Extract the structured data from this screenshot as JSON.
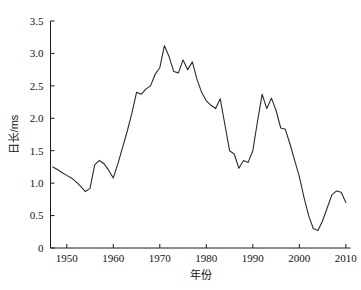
{
  "chart_data": {
    "type": "line",
    "title": "",
    "xlabel": "年份",
    "ylabel": "日长/ms",
    "xlim": [
      1946.5,
      2011.0
    ],
    "ylim": [
      0,
      3.5
    ],
    "grid": false,
    "legend": null,
    "xticks": [
      "1950",
      "1960",
      "1970",
      "1980",
      "1990",
      "2000",
      "2010"
    ],
    "xtick_values": [
      1950,
      1960,
      1970,
      1980,
      1990,
      2000,
      2010
    ],
    "yticks": [
      "0",
      "0.5",
      "1.0",
      "1.5",
      "2.0",
      "2.5",
      "3.0",
      "3.5"
    ],
    "ytick_values": [
      0,
      0.5,
      1.0,
      1.5,
      2.0,
      2.5,
      3.0,
      3.5
    ],
    "series": [
      {
        "name": "日长",
        "color": "#2b2b2b",
        "x": [
          1947,
          1948,
          1949,
          1950,
          1951,
          1952,
          1953,
          1954,
          1955,
          1956,
          1957,
          1958,
          1959,
          1960,
          1961,
          1962,
          1963,
          1964,
          1965,
          1966,
          1967,
          1968,
          1969,
          1970,
          1971,
          1972,
          1973,
          1974,
          1975,
          1976,
          1977,
          1978,
          1979,
          1980,
          1981,
          1982,
          1983,
          1984,
          1985,
          1986,
          1987,
          1988,
          1989,
          1990,
          1991,
          1992,
          1993,
          1994,
          1995,
          1996,
          1997,
          1998,
          1999,
          2000,
          2001,
          2002,
          2003,
          2004,
          2005,
          2006,
          2007,
          2008,
          2009,
          2010
        ],
        "values": [
          1.25,
          1.21,
          1.16,
          1.12,
          1.08,
          1.02,
          0.95,
          0.87,
          0.92,
          1.28,
          1.35,
          1.3,
          1.2,
          1.08,
          1.3,
          1.55,
          1.8,
          2.08,
          2.4,
          2.37,
          2.45,
          2.5,
          2.68,
          2.78,
          3.12,
          2.95,
          2.72,
          2.7,
          2.9,
          2.75,
          2.87,
          2.6,
          2.4,
          2.27,
          2.2,
          2.15,
          2.3,
          1.9,
          1.5,
          1.45,
          1.23,
          1.35,
          1.32,
          1.5,
          1.95,
          2.37,
          2.15,
          2.31,
          2.12,
          1.85,
          1.83,
          1.6,
          1.35,
          1.1,
          0.78,
          0.5,
          0.3,
          0.27,
          0.42,
          0.62,
          0.82,
          0.88,
          0.86,
          0.7
        ]
      }
    ]
  }
}
